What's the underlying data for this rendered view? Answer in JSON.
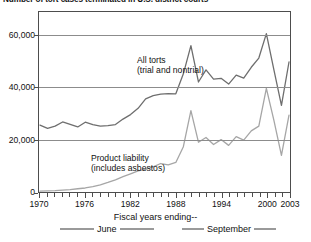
{
  "chart_data": {
    "type": "line",
    "title": "Number of tort cases terminated in U.S. district courts",
    "xlabel": "Fiscal years ending--",
    "ylabel": "",
    "xlim": [
      1970,
      2003
    ],
    "ylim": [
      0,
      66000
    ],
    "grid": true,
    "legend_position": "bottom",
    "x_ticks": [
      "1970",
      "1976",
      "1982",
      "1988",
      "1994",
      "2000",
      "2003"
    ],
    "x_tick_values": [
      1970,
      1976,
      1982,
      1988,
      1994,
      2000,
      2003
    ],
    "y_ticks": [
      "0",
      "20,000",
      "40,000",
      "60,000"
    ],
    "y_tick_values": [
      0,
      20000,
      40000,
      60000
    ],
    "x": [
      1970,
      1971,
      1972,
      1973,
      1974,
      1975,
      1976,
      1977,
      1978,
      1979,
      1980,
      1981,
      1982,
      1983,
      1984,
      1985,
      1986,
      1987,
      1988,
      1989,
      1990,
      1991,
      1992,
      1993,
      1994,
      1995,
      1996,
      1997,
      1998,
      1999,
      2000,
      2001,
      2002,
      2003
    ],
    "series": [
      {
        "name": "All torts (trial and nontrial)",
        "color": "#6e6e6e",
        "annotation_line1": "All torts",
        "annotation_line2": "(trial and nontrial)",
        "values": [
          26000,
          24800,
          25600,
          27200,
          26300,
          25300,
          27100,
          26200,
          25600,
          25800,
          26200,
          28300,
          30000,
          32400,
          36000,
          37200,
          37800,
          38000,
          37900,
          45500,
          56200,
          42400,
          47000,
          43500,
          43800,
          41600,
          45000,
          43900,
          48000,
          51500,
          60800,
          47000,
          33500,
          50000
        ]
      },
      {
        "name": "Product liability (includes asbestos)",
        "color": "#a6a6a6",
        "annotation_line1": "Product liability",
        "annotation_line2": "(includes asbestos)",
        "values": [
          900,
          1000,
          1100,
          1300,
          1500,
          1800,
          2100,
          2600,
          3300,
          4200,
          5200,
          6400,
          7500,
          8600,
          9200,
          10100,
          11400,
          10900,
          11800,
          17800,
          31500,
          19500,
          21300,
          18600,
          20500,
          18300,
          21600,
          20300,
          23800,
          25600,
          40000,
          27800,
          14500,
          29800
        ]
      }
    ],
    "legend": [
      {
        "label": "June",
        "color": "#9a9a9a"
      },
      {
        "label": "September",
        "color": "#9a9a9a"
      }
    ]
  }
}
